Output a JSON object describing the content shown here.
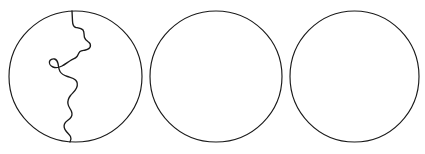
{
  "figure": {
    "canvas": {
      "width": 425,
      "height": 154,
      "background_color": "#ffffff"
    },
    "stroke_color": "#1a1a1a",
    "shape_count": 3,
    "caption": "",
    "shapes": [
      {
        "name": "circle-1",
        "label": "",
        "type": "circle",
        "cx": 75.5,
        "cy": 76.5,
        "rx": 66.5,
        "ry": 65.5,
        "divided": true,
        "divider": {
          "name": "irregular-divider-curve",
          "type": "freeform-open-curve",
          "start": [
            72,
            11
          ],
          "end": [
            70,
            142
          ],
          "description": "wavy jigsaw-like line splitting the circle into two unequal parts"
        }
      },
      {
        "name": "circle-2",
        "label": "",
        "type": "circle",
        "cx": 216,
        "cy": 76.5,
        "rx": 66,
        "ry": 65.5,
        "divided": false,
        "divider": null
      },
      {
        "name": "circle-3",
        "label": "",
        "type": "circle",
        "cx": 354.5,
        "cy": 76.5,
        "rx": 64.5,
        "ry": 65.5,
        "divided": false,
        "divider": null
      }
    ],
    "divider_path": "M 72 11 L 72.5 21 C 72.6 25 73.5 27 76 27.5 C 79 28 81.5 28.2 83 30 C 84.5 32 83.8 35 84.5 37.5 C 85.2 40 87 41 88.5 42 C 90 43 90.8 44.5 90.3 46.5 C 89.8 48.5 87.5 49.5 85.5 50 C 83.5 50.5 81.5 50.2 80 51.5 C 78.5 52.8 78.2 55 77 56.5 C 75.5 58.5 73 59 70.5 60.5 C 67.5 62.3 65 64.5 62 66 C 59 67.5 55.5 68 53 67 C 50.5 66 49 63.5 49.5 61.5 C 50 59.5 52.5 58.5 54.5 59 C 56.5 59.5 57.5 61.5 58 63.5 C 58.6 66 58.5 69 60 71.5 C 61.5 74 64.5 75.5 67.5 76.5 C 70.5 77.5 73.5 78 75.5 80 C 77.5 82 77.8 85 76.5 88 C 75.2 91 72.5 93 70.5 95.5 C 68.5 98 67.5 101 68 104 C 68.5 107 70.5 109 71.5 111.5 C 72.5 114 72 116.5 70 118.5 C 68 120.5 65.5 121.5 64.5 124 C 63.5 126.5 64.5 129 66 131 C 67.5 133 69.5 134.5 70.5 136.5 C 71.3 138.2 71 140.5 70 142"
  }
}
